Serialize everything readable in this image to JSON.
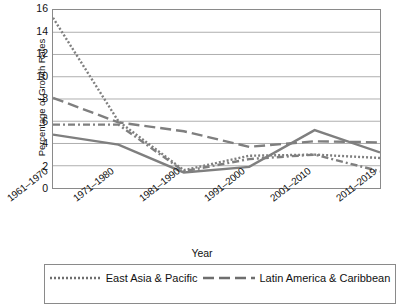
{
  "chart_data": {
    "type": "line",
    "title": "",
    "xlabel": "Year",
    "ylabel": "Percentage of Growth Rates",
    "categories": [
      "1961–1970",
      "1971–1980",
      "1981–1990",
      "1991–2000",
      "2001–2010",
      "2011–2019"
    ],
    "ylim": [
      0,
      16
    ],
    "yticks": [
      0,
      2,
      4,
      6,
      8,
      10,
      12,
      14,
      16
    ],
    "grid": "horizontal",
    "legend_position": "bottom",
    "series": [
      {
        "name": "East Asia & Pacific",
        "style": "dotted",
        "color": "#7f7f7f",
        "values": [
          15.3,
          6.0,
          1.6,
          2.9,
          3.0,
          2.7
        ]
      },
      {
        "name": "Latin America & Caribbean",
        "style": "dashed",
        "color": "#7f7f7f",
        "values": [
          8.1,
          5.9,
          5.1,
          3.7,
          4.2,
          4.1
        ]
      },
      {
        "name": "",
        "style": "dash-dot",
        "color": "#7f7f7f",
        "values": [
          5.7,
          5.7,
          1.5,
          2.6,
          3.0,
          1.5
        ]
      },
      {
        "name": "",
        "style": "solid",
        "color": "#7f7f7f",
        "values": [
          4.8,
          3.9,
          1.4,
          1.9,
          5.2,
          3.2
        ]
      }
    ]
  },
  "axis": {
    "y_title": "Percentage of Growth Rates",
    "x_title": "Year",
    "y_ticks": [
      "16",
      "14",
      "12",
      "10",
      "8",
      "6",
      "4",
      "2",
      "0"
    ],
    "x_ticks": [
      "1961–1970",
      "1971–1980",
      "1981–1990",
      "1991–2000",
      "2001–2010",
      "2011–2019"
    ]
  },
  "legend": {
    "entries": [
      {
        "label": "East Asia & Pacific",
        "style": "dotted"
      },
      {
        "label": "Latin America & Caribbean",
        "style": "dashed"
      }
    ]
  }
}
